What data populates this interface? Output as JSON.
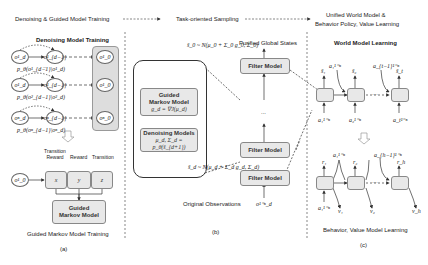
{
  "header": {
    "stage1": "Denoising & Guided Model Training",
    "stage2": "Task-oriented Sampling",
    "stage3_line1": "Unified World Model &",
    "stage3_line2": "Behavior Policy, Value Learning"
  },
  "panel_a": {
    "title": "Denoising Model Training",
    "rows": [
      {
        "start": "o¹_d",
        "next": "o¹_{d−1}",
        "end": "o¹_0",
        "prob": "p_θ(o¹_{d−1}|o¹_d)"
      },
      {
        "start": "o¹_d",
        "next": "o¹_{d−1}",
        "end": "o¹_0",
        "prob": "p_θ(o²_{d−1}|o²_d)"
      },
      {
        "start": "oⁿ_d",
        "next": "oⁿ_{d−1}",
        "end": "oⁿ_0",
        "prob": "p_θ(oⁿ_{d−1}|oⁿ_d)"
      }
    ],
    "ellipsis": "–",
    "input_node": "o¹_0",
    "columns": [
      {
        "header": "Transition Reward",
        "symbol": "x"
      },
      {
        "header": "Reward",
        "symbol": "y"
      },
      {
        "header": "Transition",
        "symbol": "z"
      }
    ],
    "guided_box_line1": "Guided",
    "guided_box_line2": "Markov Model",
    "caption": "Guided Markov Model Training",
    "label": "(a)"
  },
  "panel_b": {
    "guided_box_line1": "Guided",
    "guided_box_line2": "Markov Model",
    "guided_box_formula": "g_d = ∇J(μ_d)",
    "denoise_box_line1": "Denoising Models",
    "denoise_box_formula": "μ_d, Σ_d = p_θ(ŝ_{d+1})",
    "top_formula": "ŝ_0 ~ N(μ_0 + Σ_0 g_0, Σ_0)",
    "mid_formula": "ŝ_d ~ N(μ_d + Σ_d g_d, Σ_d)",
    "output_label": "Purified Global States",
    "filter_top": "Filter Model",
    "filter_mid": "Filter Model",
    "filter_bottom": "Filter Model",
    "dots": "...",
    "input_label": "Original Observations",
    "input_symbol": "o¹⁻ⁿ_d",
    "label": "(b)"
  },
  "panel_c": {
    "world_title": "World Model Learning",
    "world_outputs": [
      "ŝ₁",
      "ŝ₂",
      "ŝ_t"
    ],
    "world_inputs": [
      "a₁¹⁻ⁿ",
      "a₂¹⁻ⁿ",
      "a_t¹⁻ⁿ"
    ],
    "world_side_actions": [
      "a₁¹⁻ⁿ",
      "a_{t−1}¹⁻ⁿ"
    ],
    "world_dots": "···",
    "behavior_outputs": [
      "r₁",
      "r₂",
      "r_h"
    ],
    "behavior_side_actions": [
      "a₁¹⁻ⁿ",
      "a_{h−1}¹⁻ⁿ"
    ],
    "behavior_input": "a₁¹⁻ⁿ",
    "values": [
      "v₁",
      "v₂",
      "v_h"
    ],
    "behavior_dots": "···",
    "caption": "Behavior, Value Model Learning",
    "label": "(c)"
  },
  "colors": {
    "box_fill": "#e8e8e8",
    "box_border": "#888888",
    "line": "#444444"
  }
}
